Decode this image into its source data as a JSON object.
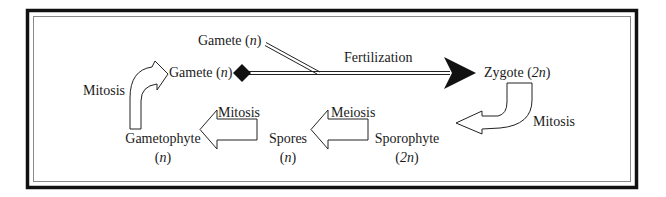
{
  "diagram": {
    "colors": {
      "frame": "#111111",
      "inner_frame": "#8a8a8a",
      "arrow_stroke": "#222222",
      "text": "#1a1a1a",
      "background": "#ffffff"
    },
    "nodes": {
      "gamete_top": {
        "name": "Gamete",
        "ploidy": "n"
      },
      "gamete_left": {
        "name": "Gamete",
        "ploidy": "n"
      },
      "zygote": {
        "name": "Zygote",
        "ploidy": "2n"
      },
      "sporophyte": {
        "name": "Sporophyte",
        "ploidy": "2n"
      },
      "spores": {
        "name": "Spores",
        "ploidy": "n"
      },
      "gametophyte": {
        "name": "Gametophyte",
        "ploidy": "n"
      }
    },
    "processes": {
      "fertilization": "Fertilization",
      "mitosis_zygote": "Mitosis",
      "meiosis": "Meiosis",
      "mitosis_spores": "Mitosis",
      "mitosis_gametophyte": "Mitosis"
    },
    "edges": [
      {
        "from": "Gamete (n) + Gamete (n)",
        "to": "Zygote (2n)",
        "label": "Fertilization"
      },
      {
        "from": "Zygote (2n)",
        "to": "Sporophyte (2n)",
        "label": "Mitosis"
      },
      {
        "from": "Sporophyte (2n)",
        "to": "Spores (n)",
        "label": "Meiosis"
      },
      {
        "from": "Spores (n)",
        "to": "Gametophyte (n)",
        "label": "Mitosis"
      },
      {
        "from": "Gametophyte (n)",
        "to": "Gamete (n)",
        "label": "Mitosis"
      }
    ],
    "paren_open": "(",
    "paren_close": ")"
  }
}
